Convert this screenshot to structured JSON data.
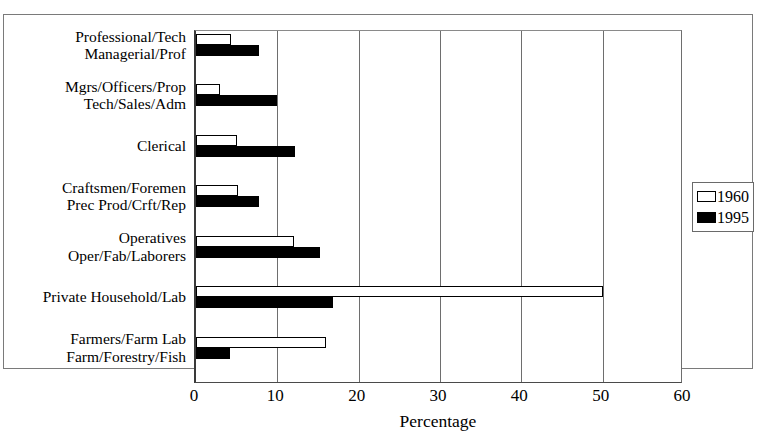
{
  "chart_data": {
    "type": "bar",
    "orientation": "horizontal",
    "title": "",
    "xlabel": "Percentage",
    "ylabel": "",
    "xlim": [
      0,
      60
    ],
    "xticks": [
      0,
      10,
      20,
      30,
      40,
      50,
      60
    ],
    "xtick_labels": [
      "0",
      "10",
      "20",
      "30",
      "40",
      "50",
      "60"
    ],
    "grid": true,
    "legend_position": "right",
    "categories": [
      "Professional/Tech\nManagerial/Prof",
      "Mgrs/Officers/Prop\nTech/Sales/Adm",
      "Clerical",
      "Craftsmen/Foremen\nPrec Prod/Crft/Rep",
      "Operatives\nOper/Fab/Laborers",
      "Private Household/Lab",
      "Farmers/Farm Lab\nFarm/Forestry/Fish"
    ],
    "category_lines": [
      [
        "Professional/Tech",
        "Managerial/Prof"
      ],
      [
        "Mgrs/Officers/Prop",
        "Tech/Sales/Adm"
      ],
      [
        "Clerical"
      ],
      [
        "Craftsmen/Foremen",
        "Prec Prod/Crft/Rep"
      ],
      [
        "Operatives",
        "Oper/Fab/Laborers"
      ],
      [
        "Private Household/Lab"
      ],
      [
        "Farmers/Farm Lab",
        "Farm/Forestry/Fish"
      ]
    ],
    "series": [
      {
        "name": "1960",
        "color": "#ffffff",
        "edge_color": "#000000",
        "values": [
          4.3,
          3.0,
          5.0,
          5.2,
          12.0,
          50.0,
          16.0
        ]
      },
      {
        "name": "1995",
        "color": "#000000",
        "edge_color": "#000000",
        "values": [
          7.7,
          10.0,
          12.2,
          7.8,
          15.2,
          16.8,
          4.2
        ]
      }
    ]
  },
  "legend": {
    "entries": [
      {
        "label": "1960"
      },
      {
        "label": "1995"
      }
    ]
  },
  "axis": {
    "x_title": "Percentage",
    "tick_labels": [
      "0",
      "10",
      "20",
      "30",
      "40",
      "50",
      "60"
    ]
  }
}
